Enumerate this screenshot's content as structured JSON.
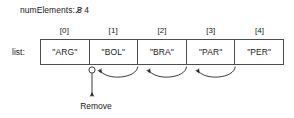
{
  "diagram": {
    "type": "array-removal-shift-diagram",
    "num_elements": {
      "label": "numElements:",
      "old_value": "5",
      "new_value": "4",
      "old_value_struck": true
    },
    "list": {
      "label": "list:",
      "indices": [
        "[0]",
        "[1]",
        "[2]",
        "[3]",
        "[4]"
      ],
      "values": [
        "\"ARG\"",
        "\"BOL\"",
        "\"BRA\"",
        "\"PAR\"",
        "\"PER\""
      ]
    },
    "annotations": {
      "remove_label": "Remove",
      "remove_target_index": "[1]",
      "shift_arrow_count": 3
    },
    "colors": {
      "background": "#ffffff",
      "text": "#1a1a1a",
      "border": "#4d4d4d",
      "arrow": "#262626"
    }
  }
}
